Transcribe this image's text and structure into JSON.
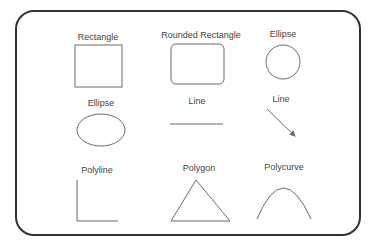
{
  "cells": [
    {
      "label": "Rectangle",
      "shape": "rectangle"
    },
    {
      "label": "Rounded Rectangle",
      "shape": "rounded-rectangle"
    },
    {
      "label": "Ellipse",
      "shape": "circle"
    },
    {
      "label": "Ellipse",
      "shape": "ellipse"
    },
    {
      "label": "Line",
      "shape": "horizontal-line"
    },
    {
      "label": "Line",
      "shape": "diagonal-arrow-line"
    },
    {
      "label": "Polyline",
      "shape": "polyline"
    },
    {
      "label": "Polygon",
      "shape": "triangle"
    },
    {
      "label": "Polycurve",
      "shape": "curve"
    }
  ],
  "colors": {
    "frame": "#333333",
    "shape_stroke": "#6b6b6b",
    "label": "#444444"
  }
}
